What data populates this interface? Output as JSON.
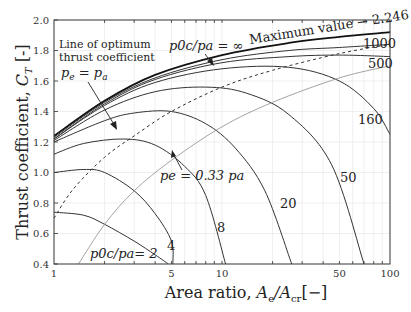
{
  "chart_data": {
    "type": "line",
    "title": "",
    "xlabel": "Area ratio, A_e/A_cr [−]",
    "ylabel": "Thrust coefficient, C_T [-]",
    "xscale": "log",
    "xlim": [
      1,
      100
    ],
    "ylim": [
      0.4,
      2.0
    ],
    "grid": true,
    "x_ticks": [
      1,
      5,
      10,
      50,
      100
    ],
    "x_tick_labels": [
      "1",
      "5",
      "10",
      "50",
      "100"
    ],
    "y_ticks": [
      0.4,
      0.6,
      0.8,
      1.0,
      1.2,
      1.4,
      1.6,
      1.8,
      2.0
    ],
    "y_tick_labels": [
      "0.4",
      "0.6",
      "0.8",
      "1.0",
      "1.2",
      "1.4",
      "1.6",
      "1.8",
      "2.0"
    ],
    "series": [
      {
        "name": "p0c/pa = 2",
        "label": "p0c/pa= 2",
        "style": "solid",
        "x": [
          1,
          1.5,
          2,
          3,
          4,
          4.8
        ],
        "y": [
          0.74,
          0.72,
          0.66,
          0.55,
          0.46,
          0.4
        ]
      },
      {
        "name": "p0c/pa = 4",
        "label": "4",
        "style": "solid",
        "x": [
          1,
          1.5,
          2,
          3,
          4,
          5,
          5.1
        ],
        "y": [
          1.0,
          1.02,
          1.0,
          0.88,
          0.73,
          0.55,
          0.4
        ]
      },
      {
        "name": "p0c/pa = 8",
        "label": "8",
        "style": "solid",
        "x": [
          1,
          1.5,
          2.6,
          4,
          6,
          8,
          10.5
        ],
        "y": [
          1.12,
          1.19,
          1.22,
          1.18,
          1.04,
          0.85,
          0.4
        ]
      },
      {
        "name": "p0c/pa = 20",
        "label": "20",
        "style": "solid",
        "x": [
          1,
          2,
          3,
          5,
          8,
          12,
          18,
          26
        ],
        "y": [
          1.2,
          1.34,
          1.39,
          1.4,
          1.32,
          1.16,
          0.88,
          0.4
        ]
      },
      {
        "name": "p0c/pa = 50",
        "label": "50",
        "style": "solid",
        "x": [
          1,
          2,
          4,
          8,
          14,
          25,
          45,
          70
        ],
        "y": [
          1.21,
          1.41,
          1.53,
          1.56,
          1.52,
          1.38,
          1.05,
          0.4
        ]
      },
      {
        "name": "p0c/pa = 160",
        "label": "160",
        "style": "solid",
        "x": [
          1,
          2,
          4,
          10,
          25,
          50,
          80,
          100
        ],
        "y": [
          1.22,
          1.44,
          1.59,
          1.68,
          1.69,
          1.6,
          1.42,
          1.25
        ]
      },
      {
        "name": "p0c/pa = 500",
        "label": "500",
        "style": "solid",
        "x": [
          1,
          2,
          4,
          10,
          25,
          50,
          100
        ],
        "y": [
          1.22,
          1.45,
          1.61,
          1.72,
          1.76,
          1.77,
          1.76
        ]
      },
      {
        "name": "p0c/pa = 1000",
        "label": "1000",
        "style": "solid",
        "x": [
          1,
          2,
          4,
          10,
          25,
          50,
          100
        ],
        "y": [
          1.23,
          1.46,
          1.62,
          1.74,
          1.8,
          1.82,
          1.84
        ]
      },
      {
        "name": "p0c/pa = ∞",
        "label": "p0c/pa=∞",
        "style": "solid-bold",
        "x": [
          1,
          2,
          4,
          10,
          25,
          50,
          100
        ],
        "y": [
          1.24,
          1.47,
          1.64,
          1.77,
          1.85,
          1.89,
          1.92
        ]
      },
      {
        "name": "Line of optimum thrust coefficient (pe = pa)",
        "style": "dashed",
        "x": [
          1,
          1.3,
          2,
          3,
          5,
          10,
          20,
          50,
          100
        ],
        "y": [
          0.7,
          0.89,
          1.1,
          1.24,
          1.4,
          1.56,
          1.67,
          1.78,
          1.84
        ]
      },
      {
        "name": "pe = 0.33 pa",
        "style": "solid-gray",
        "x": [
          1.4,
          2,
          3,
          5,
          10,
          20,
          50,
          100
        ],
        "y": [
          0.4,
          0.66,
          0.88,
          1.08,
          1.3,
          1.46,
          1.62,
          1.7
        ]
      }
    ],
    "annotations": [
      {
        "text": "Line of optimum thrust coefficient",
        "math": "p_e = p_a"
      },
      {
        "text": "p0c/pa = ∞"
      },
      {
        "text": "Maximum value → 2.246"
      },
      {
        "text": "pe = 0.33 pa"
      }
    ],
    "legend": "none (inline labels)"
  },
  "labels": {
    "y_axis": "Thrust coefficient, ",
    "y_axis_sym": "C",
    "y_axis_sub": "T",
    "y_axis_unit": " [-]",
    "x_axis": "Area ratio, ",
    "x_axis_sym1": "A",
    "x_axis_sub1": "e",
    "x_axis_sym2": "/A",
    "x_axis_sub2": "cr",
    "x_axis_unit": "[−]",
    "optimum_line1": "Line of optimum",
    "optimum_line2": "thrust coefficient",
    "optimum_math": "p",
    "optimum_sub_e": "e",
    "optimum_eq": " = p",
    "optimum_sub_a": "a",
    "infinity_label": "p0c/pa = ∞",
    "max_value": "Maximum value → 2.246",
    "pe033": "pe = 0.33 pa",
    "c2": "p0c/pa= 2",
    "c4": "4",
    "c8": "8",
    "c20": "20",
    "c50": "50",
    "c160": "160",
    "c500": "500",
    "c1000": "1000"
  }
}
